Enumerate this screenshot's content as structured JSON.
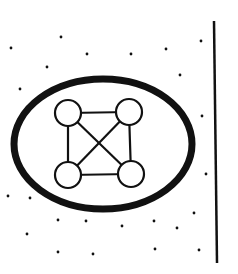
{
  "diagram": {
    "colors": {
      "background": "#ffffff",
      "ink": "#111111"
    },
    "boundary_ellipse": {
      "cx": 103,
      "cy": 144,
      "rx": 89,
      "ry": 65,
      "stroke_width": 7
    },
    "nodes": [
      {
        "id": "top-left",
        "cx": 68,
        "cy": 113,
        "r": 13
      },
      {
        "id": "top-right",
        "cx": 129,
        "cy": 112,
        "r": 13
      },
      {
        "id": "bottom-left",
        "cx": 68,
        "cy": 175,
        "r": 13
      },
      {
        "id": "bottom-right",
        "cx": 131,
        "cy": 174,
        "r": 13
      }
    ],
    "edges": [
      [
        "top-left",
        "top-right"
      ],
      [
        "bottom-left",
        "bottom-right"
      ],
      [
        "top-left",
        "bottom-left"
      ],
      [
        "top-right",
        "bottom-right"
      ],
      [
        "top-left",
        "bottom-right"
      ],
      [
        "top-right",
        "bottom-left"
      ]
    ],
    "divider_line": {
      "x1": 214,
      "y1": 21,
      "x2": 217,
      "y2": 263,
      "stroke_width": 2.5
    },
    "dots": [
      [
        61,
        37
      ],
      [
        11,
        48
      ],
      [
        87,
        54
      ],
      [
        47,
        67
      ],
      [
        20,
        89
      ],
      [
        131,
        54
      ],
      [
        166,
        49
      ],
      [
        201,
        41
      ],
      [
        180,
        75
      ],
      [
        202,
        116
      ],
      [
        206,
        174
      ],
      [
        8,
        196
      ],
      [
        30,
        198
      ],
      [
        194,
        213
      ],
      [
        58,
        220
      ],
      [
        86,
        221
      ],
      [
        122,
        226
      ],
      [
        154,
        221
      ],
      [
        177,
        228
      ],
      [
        27,
        234
      ],
      [
        58,
        252
      ],
      [
        93,
        254
      ],
      [
        155,
        249
      ],
      [
        199,
        250
      ]
    ]
  }
}
